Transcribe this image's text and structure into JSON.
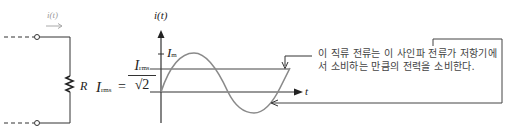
{
  "circuit": {
    "current_label": "i(t)",
    "resistor_label": "R"
  },
  "equation": {
    "lhs_symbol": "I",
    "lhs_subscript": "rms",
    "equals": "=",
    "numerator_symbol": "I",
    "numerator_subscript": "rms",
    "denominator": "√2"
  },
  "graph": {
    "y_axis_label": "i(t)",
    "x_axis_label": "t",
    "peak_label_symbol": "I",
    "peak_label_subscript": "m"
  },
  "callout": {
    "text": "이 직류 전류는 이 사인파 전류가 저항기에서 소비하는 만큼의 전력을 소비한다."
  },
  "colors": {
    "line": "#333333",
    "curve": "#8a8a8a",
    "light_label": "#9a9a9a"
  }
}
